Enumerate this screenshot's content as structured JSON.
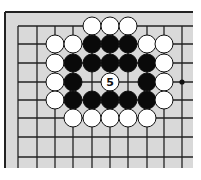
{
  "diagram": {
    "type": "go-board-fragment",
    "board_color": "#d9d9d9",
    "line_color": "#222222",
    "page_color": "#ffffff",
    "columns_x": [
      18,
      37,
      55,
      73,
      92,
      110,
      128,
      147,
      164,
      182
    ],
    "rows_y": [
      26,
      44,
      63,
      82,
      100,
      118,
      137,
      157
    ],
    "stone_radius": 9,
    "hoshi": [
      {
        "col": 9,
        "row": 3
      }
    ],
    "stones": [
      {
        "color": "white",
        "col": 4,
        "row": 0
      },
      {
        "color": "white",
        "col": 5,
        "row": 0
      },
      {
        "color": "white",
        "col": 6,
        "row": 0
      },
      {
        "color": "white",
        "col": 2,
        "row": 1
      },
      {
        "color": "white",
        "col": 3,
        "row": 1
      },
      {
        "color": "black",
        "col": 4,
        "row": 1
      },
      {
        "color": "black",
        "col": 5,
        "row": 1
      },
      {
        "color": "black",
        "col": 6,
        "row": 1
      },
      {
        "color": "white",
        "col": 7,
        "row": 1
      },
      {
        "color": "white",
        "col": 8,
        "row": 1
      },
      {
        "color": "white",
        "col": 2,
        "row": 2
      },
      {
        "color": "black",
        "col": 3,
        "row": 2
      },
      {
        "color": "black",
        "col": 4,
        "row": 2
      },
      {
        "color": "black",
        "col": 5,
        "row": 2
      },
      {
        "color": "black",
        "col": 6,
        "row": 2
      },
      {
        "color": "black",
        "col": 7,
        "row": 2
      },
      {
        "color": "white",
        "col": 8,
        "row": 2
      },
      {
        "color": "white",
        "col": 2,
        "row": 3
      },
      {
        "color": "black",
        "col": 3,
        "row": 3
      },
      {
        "color": "white",
        "col": 5,
        "row": 3,
        "label": "5"
      },
      {
        "color": "black",
        "col": 7,
        "row": 3
      },
      {
        "color": "white",
        "col": 8,
        "row": 3
      },
      {
        "color": "white",
        "col": 2,
        "row": 4
      },
      {
        "color": "black",
        "col": 3,
        "row": 4
      },
      {
        "color": "black",
        "col": 4,
        "row": 4
      },
      {
        "color": "black",
        "col": 5,
        "row": 4
      },
      {
        "color": "black",
        "col": 6,
        "row": 4
      },
      {
        "color": "black",
        "col": 7,
        "row": 4
      },
      {
        "color": "white",
        "col": 8,
        "row": 4
      },
      {
        "color": "white",
        "col": 3,
        "row": 5
      },
      {
        "color": "white",
        "col": 4,
        "row": 5
      },
      {
        "color": "white",
        "col": 5,
        "row": 5
      },
      {
        "color": "white",
        "col": 6,
        "row": 5
      },
      {
        "color": "white",
        "col": 7,
        "row": 5
      }
    ],
    "move_label": "5"
  }
}
